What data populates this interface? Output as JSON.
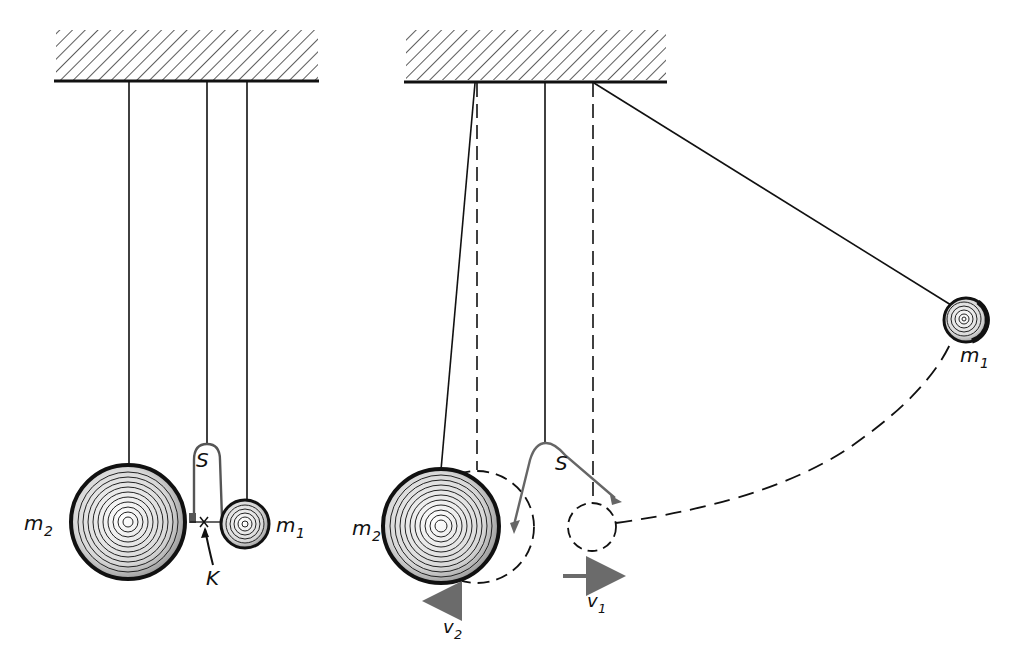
{
  "figure": {
    "colors": {
      "ink": "#111111",
      "spring": "#666666",
      "arrow": "#6b6b6b",
      "hatch": "#333333"
    }
  },
  "left_panel": {
    "labels": {
      "mass_large": "m",
      "mass_large_sub": "2",
      "mass_small": "m",
      "mass_small_sub": "1",
      "spring": "S",
      "thread": "K"
    }
  },
  "right_panel": {
    "labels": {
      "mass_large": "m",
      "mass_large_sub": "2",
      "mass_small": "m",
      "mass_small_sub": "1",
      "spring": "S",
      "velocity_1": "v",
      "velocity_1_sub": "1",
      "velocity_2": "v",
      "velocity_2_sub": "2"
    }
  }
}
